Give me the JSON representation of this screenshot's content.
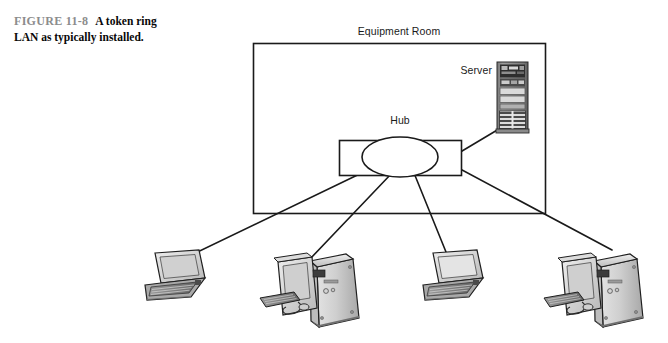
{
  "figure": {
    "number": "FIGURE 11-8",
    "caption": "A token ring LAN as typically installed."
  },
  "diagram": {
    "type": "network-topology",
    "room_label": "Equipment Room",
    "hub_label": "Hub",
    "server_label": "Server",
    "colors": {
      "line": "#1a1a1a",
      "text": "#1a1a1a",
      "caption_label": "#8c8c8c",
      "device_light": "#d8d8d8",
      "device_mid": "#b4b4b4",
      "device_dark": "#6e6e6e",
      "device_darkest": "#3a3a3a",
      "screen": "#e8e8e8",
      "background": "#ffffff"
    },
    "nodes": [
      {
        "id": "hub",
        "label": "Hub",
        "kind": "hub",
        "x": 400,
        "y": 157
      },
      {
        "id": "server",
        "label": "Server",
        "kind": "server-tower",
        "x": 512,
        "y": 96
      },
      {
        "id": "pc1",
        "label": "",
        "kind": "laptop",
        "x": 175,
        "y": 278
      },
      {
        "id": "pc2",
        "label": "",
        "kind": "desktop-tower",
        "x": 312,
        "y": 287
      },
      {
        "id": "pc3",
        "label": "",
        "kind": "laptop",
        "x": 452,
        "y": 278
      },
      {
        "id": "pc4",
        "label": "",
        "kind": "desktop-tower",
        "x": 596,
        "y": 287
      }
    ],
    "links": [
      {
        "from": "hub",
        "to": "server"
      },
      {
        "from": "hub",
        "to": "pc1"
      },
      {
        "from": "hub",
        "to": "pc2"
      },
      {
        "from": "hub",
        "to": "pc3"
      },
      {
        "from": "hub",
        "to": "pc4"
      }
    ]
  }
}
